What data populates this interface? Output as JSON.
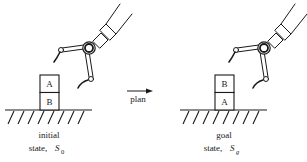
{
  "diagram": {
    "type": "blocks-world planning illustration",
    "colors": {
      "ink": "#1a1a1a",
      "background": "#ffffff"
    },
    "initial": {
      "label_line1": "initial",
      "label_line2": "state,",
      "symbol": "S",
      "subscript": "0",
      "blocks": [
        {
          "name": "A",
          "position": "top"
        },
        {
          "name": "B",
          "position": "bottom"
        }
      ]
    },
    "arrow": {
      "label": "plan"
    },
    "goal": {
      "label_line1": "goal",
      "label_line2": "state,",
      "symbol": "S",
      "subscript": "g",
      "blocks": [
        {
          "name": "B",
          "position": "top"
        },
        {
          "name": "A",
          "position": "bottom"
        }
      ]
    }
  }
}
